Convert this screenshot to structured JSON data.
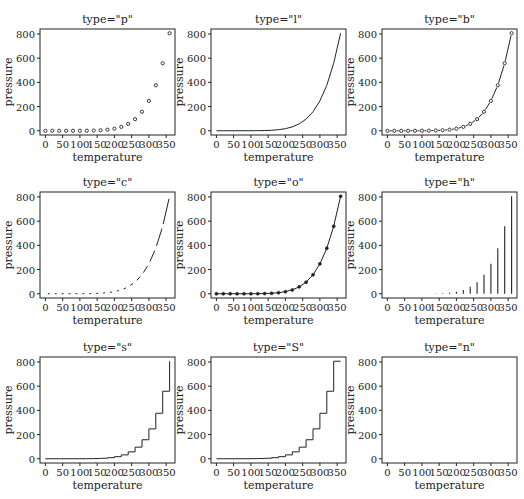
{
  "figure": {
    "panel_label": "b)"
  },
  "chart_data": [
    {
      "type": "scatter",
      "plot_type": "p",
      "title": "type=\"p\"",
      "xlabel": "temperature",
      "ylabel": "pressure",
      "xlim": [
        0,
        360
      ],
      "ylim": [
        0,
        806
      ],
      "xticks": [
        0,
        50,
        100,
        150,
        200,
        250,
        300,
        350
      ],
      "yticks": [
        0,
        200,
        400,
        600,
        800
      ],
      "grid": false,
      "x": [
        0,
        20,
        40,
        60,
        80,
        100,
        120,
        140,
        160,
        180,
        200,
        220,
        240,
        260,
        280,
        300,
        320,
        340,
        360
      ],
      "y": [
        0.0002,
        0.0012,
        0.006,
        0.03,
        0.09,
        0.27,
        0.75,
        1.85,
        4.2,
        8.8,
        17.3,
        32.1,
        57.0,
        96.0,
        157.0,
        247.0,
        376.0,
        558.0,
        806.0
      ]
    },
    {
      "type": "line",
      "plot_type": "l",
      "title": "type=\"l\"",
      "xlabel": "temperature",
      "ylabel": "pressure",
      "xlim": [
        0,
        360
      ],
      "ylim": [
        0,
        806
      ],
      "xticks": [
        0,
        50,
        100,
        150,
        200,
        250,
        300,
        350
      ],
      "yticks": [
        0,
        200,
        400,
        600,
        800
      ],
      "grid": false,
      "x": [
        0,
        20,
        40,
        60,
        80,
        100,
        120,
        140,
        160,
        180,
        200,
        220,
        240,
        260,
        280,
        300,
        320,
        340,
        360
      ],
      "y": [
        0.0002,
        0.0012,
        0.006,
        0.03,
        0.09,
        0.27,
        0.75,
        1.85,
        4.2,
        8.8,
        17.3,
        32.1,
        57.0,
        96.0,
        157.0,
        247.0,
        376.0,
        558.0,
        806.0
      ]
    },
    {
      "type": "line",
      "plot_type": "b",
      "title": "type=\"b\"",
      "xlabel": "temperature",
      "ylabel": "pressure",
      "xlim": [
        0,
        360
      ],
      "ylim": [
        0,
        806
      ],
      "xticks": [
        0,
        50,
        100,
        150,
        200,
        250,
        300,
        350
      ],
      "yticks": [
        0,
        200,
        400,
        600,
        800
      ],
      "grid": false,
      "x": [
        0,
        20,
        40,
        60,
        80,
        100,
        120,
        140,
        160,
        180,
        200,
        220,
        240,
        260,
        280,
        300,
        320,
        340,
        360
      ],
      "y": [
        0.0002,
        0.0012,
        0.006,
        0.03,
        0.09,
        0.27,
        0.75,
        1.85,
        4.2,
        8.8,
        17.3,
        32.1,
        57.0,
        96.0,
        157.0,
        247.0,
        376.0,
        558.0,
        806.0
      ]
    },
    {
      "type": "line",
      "plot_type": "c",
      "title": "type=\"c\"",
      "xlabel": "temperature",
      "ylabel": "pressure",
      "xlim": [
        0,
        360
      ],
      "ylim": [
        0,
        806
      ],
      "xticks": [
        0,
        50,
        100,
        150,
        200,
        250,
        300,
        350
      ],
      "yticks": [
        0,
        200,
        400,
        600,
        800
      ],
      "grid": false,
      "x": [
        0,
        20,
        40,
        60,
        80,
        100,
        120,
        140,
        160,
        180,
        200,
        220,
        240,
        260,
        280,
        300,
        320,
        340,
        360
      ],
      "y": [
        0.0002,
        0.0012,
        0.006,
        0.03,
        0.09,
        0.27,
        0.75,
        1.85,
        4.2,
        8.8,
        17.3,
        32.1,
        57.0,
        96.0,
        157.0,
        247.0,
        376.0,
        558.0,
        806.0
      ]
    },
    {
      "type": "line",
      "plot_type": "o",
      "title": "type=\"o\"",
      "xlabel": "temperature",
      "ylabel": "pressure",
      "xlim": [
        0,
        360
      ],
      "ylim": [
        0,
        806
      ],
      "xticks": [
        0,
        50,
        100,
        150,
        200,
        250,
        300,
        350
      ],
      "yticks": [
        0,
        200,
        400,
        600,
        800
      ],
      "grid": false,
      "x": [
        0,
        20,
        40,
        60,
        80,
        100,
        120,
        140,
        160,
        180,
        200,
        220,
        240,
        260,
        280,
        300,
        320,
        340,
        360
      ],
      "y": [
        0.0002,
        0.0012,
        0.006,
        0.03,
        0.09,
        0.27,
        0.75,
        1.85,
        4.2,
        8.8,
        17.3,
        32.1,
        57.0,
        96.0,
        157.0,
        247.0,
        376.0,
        558.0,
        806.0
      ]
    },
    {
      "type": "bar",
      "plot_type": "h",
      "title": "type=\"h\"",
      "xlabel": "temperature",
      "ylabel": "pressure",
      "xlim": [
        0,
        360
      ],
      "ylim": [
        0,
        806
      ],
      "xticks": [
        0,
        50,
        100,
        150,
        200,
        250,
        300,
        350
      ],
      "yticks": [
        0,
        200,
        400,
        600,
        800
      ],
      "grid": false,
      "x": [
        0,
        20,
        40,
        60,
        80,
        100,
        120,
        140,
        160,
        180,
        200,
        220,
        240,
        260,
        280,
        300,
        320,
        340,
        360
      ],
      "y": [
        0.0002,
        0.0012,
        0.006,
        0.03,
        0.09,
        0.27,
        0.75,
        1.85,
        4.2,
        8.8,
        17.3,
        32.1,
        57.0,
        96.0,
        157.0,
        247.0,
        376.0,
        558.0,
        806.0
      ]
    },
    {
      "type": "line",
      "plot_type": "s",
      "title": "type=\"s\"",
      "xlabel": "temperature",
      "ylabel": "pressure",
      "xlim": [
        0,
        360
      ],
      "ylim": [
        0,
        806
      ],
      "xticks": [
        0,
        50,
        100,
        150,
        200,
        250,
        300,
        350
      ],
      "yticks": [
        0,
        200,
        400,
        600,
        800
      ],
      "grid": false,
      "x": [
        0,
        20,
        40,
        60,
        80,
        100,
        120,
        140,
        160,
        180,
        200,
        220,
        240,
        260,
        280,
        300,
        320,
        340,
        360
      ],
      "y": [
        0.0002,
        0.0012,
        0.006,
        0.03,
        0.09,
        0.27,
        0.75,
        1.85,
        4.2,
        8.8,
        17.3,
        32.1,
        57.0,
        96.0,
        157.0,
        247.0,
        376.0,
        558.0,
        806.0
      ]
    },
    {
      "type": "line",
      "plot_type": "S",
      "title": "type=\"S\"",
      "xlabel": "temperature",
      "ylabel": "pressure",
      "xlim": [
        0,
        360
      ],
      "ylim": [
        0,
        806
      ],
      "xticks": [
        0,
        50,
        100,
        150,
        200,
        250,
        300,
        350
      ],
      "yticks": [
        0,
        200,
        400,
        600,
        800
      ],
      "grid": false,
      "x": [
        0,
        20,
        40,
        60,
        80,
        100,
        120,
        140,
        160,
        180,
        200,
        220,
        240,
        260,
        280,
        300,
        320,
        340,
        360
      ],
      "y": [
        0.0002,
        0.0012,
        0.006,
        0.03,
        0.09,
        0.27,
        0.75,
        1.85,
        4.2,
        8.8,
        17.3,
        32.1,
        57.0,
        96.0,
        157.0,
        247.0,
        376.0,
        558.0,
        806.0
      ]
    },
    {
      "type": "scatter",
      "plot_type": "n",
      "title": "type=\"n\"",
      "xlabel": "temperature",
      "ylabel": "pressure",
      "xlim": [
        0,
        360
      ],
      "ylim": [
        0,
        806
      ],
      "xticks": [
        0,
        50,
        100,
        150,
        200,
        250,
        300,
        350
      ],
      "yticks": [
        0,
        200,
        400,
        600,
        800
      ],
      "grid": false,
      "x": [],
      "y": []
    }
  ],
  "layout": {
    "col_x": [
      40,
      211,
      382
    ],
    "row_y": [
      29,
      192,
      357
    ],
    "plot_w": 135,
    "plot_h": 106,
    "ink": "#222222"
  }
}
